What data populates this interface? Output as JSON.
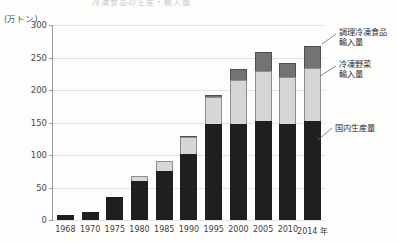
{
  "chart_data": {
    "type": "bar",
    "stacked": true,
    "title": "冷凍食品の生産・輸入量",
    "unit_label": "(万トン)",
    "xlabel": "年",
    "ylabel": "",
    "ylim": [
      0,
      300
    ],
    "yticks": [
      0,
      50,
      100,
      150,
      200,
      250,
      300
    ],
    "grid": true,
    "legend_position": "right",
    "categories": [
      "1968",
      "1970",
      "1975",
      "1980",
      "1985",
      "1990",
      "1995",
      "2000",
      "2005",
      "2010",
      "2014"
    ],
    "series": [
      {
        "name": "国内生産量",
        "color": "#1f1f1f",
        "values": [
          8,
          13,
          35,
          60,
          75,
          102,
          148,
          148,
          152,
          148,
          152
        ]
      },
      {
        "name": "冷凍野菜輸入量",
        "color": "#d6d6d6",
        "values": [
          0,
          0,
          0,
          8,
          16,
          26,
          42,
          68,
          78,
          72,
          82
        ]
      },
      {
        "name": "調理冷凍食品輸入量",
        "color": "#737373",
        "values": [
          0,
          0,
          0,
          0,
          0,
          2,
          2,
          16,
          28,
          22,
          34
        ]
      }
    ],
    "totals": [
      8,
      13,
      35,
      68,
      91,
      130,
      192,
      232,
      258,
      242,
      268
    ]
  },
  "axis": {
    "unit": "(万トン)",
    "x_unit_suffix": "年",
    "y_tick_labels": [
      "300",
      "250",
      "200",
      "150",
      "100",
      "50",
      "0"
    ],
    "x_tick_labels": [
      "1968",
      "1970",
      "1975",
      "1980",
      "1985",
      "1990",
      "1995",
      "2000",
      "2005",
      "2010",
      "2014 年"
    ]
  },
  "legend": {
    "items": [
      {
        "label": "調理冷凍食品\n輸入量",
        "color": "#737373",
        "name": "prepared-frozen-food-imports"
      },
      {
        "label": "冷凍野菜\n輸入量",
        "color": "#d6d6d6",
        "name": "frozen-vegetable-imports"
      },
      {
        "label": "国内生産量",
        "color": "#1f1f1f",
        "name": "domestic-production"
      }
    ]
  },
  "title_strip": "冷凍食品の生産・輸入量"
}
